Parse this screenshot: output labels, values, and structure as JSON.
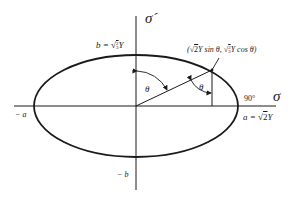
{
  "figure": {
    "type": "ellipse-yield-locus",
    "colors": {
      "stroke": "#1a1a1a",
      "background": "#ffffff"
    },
    "axes": {
      "horizontal_label": "σ",
      "vertical_label": "σ´"
    },
    "labels": {
      "b_top": {
        "prefix": "b = √",
        "frac_num": "2",
        "frac_den": "3",
        "suffix": "Y"
      },
      "a_right": {
        "prefix": "a = √",
        "radicand": "2",
        "suffix": "Y"
      },
      "neg_a": "− a",
      "neg_b": "− b",
      "theta_left": "θ",
      "theta_right": "θ",
      "right_angle": "90°",
      "point": {
        "open": "(",
        "part1_root": "√",
        "part1_radicand": "2",
        "part1_rest": "Y sin θ, ",
        "part2_root": "√",
        "part2_frac_num": "2",
        "part2_frac_den": "3",
        "part2_rest": "Y cos θ)"
      }
    }
  }
}
